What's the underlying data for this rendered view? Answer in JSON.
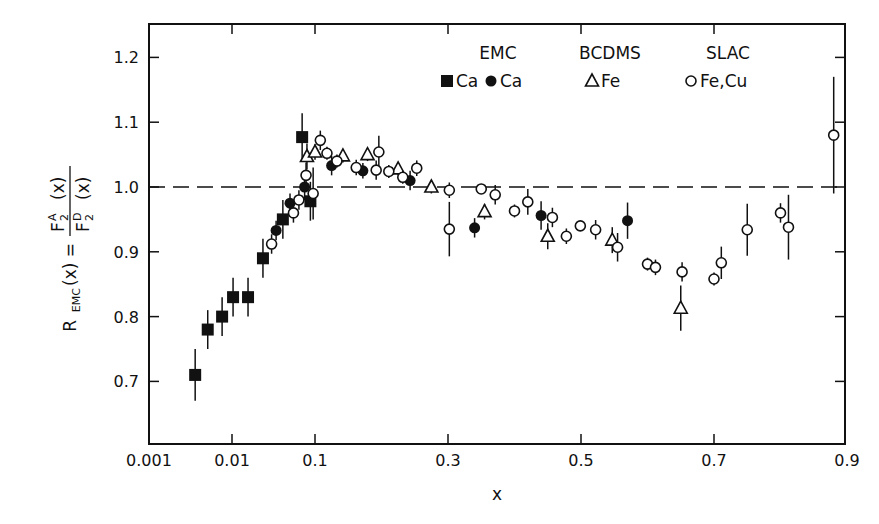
{
  "chart_data": {
    "type": "scatter",
    "title": "",
    "xlabel": "x",
    "ylabel": "R_EMC(x) = F2^A(x) / F2^D(x)",
    "ylabel_parts": {
      "lhs": "R",
      "lhs_sub": "EMC",
      "lhs_arg": "(x) =",
      "num": "F",
      "num_sub": "2",
      "num_sup": "A",
      "num_arg": "(x)",
      "den": "F",
      "den_sub": "2",
      "den_sup": "D",
      "den_arg": "(x)"
    },
    "x_scale": "log from 0.001 to 0.1, linear from 0.1 to 0.9",
    "xlim": [
      0.001,
      0.9
    ],
    "ylim": [
      0.6,
      1.25
    ],
    "x_ticks": [
      "0.001",
      "0.01",
      "0.1",
      "0.3",
      "0.5",
      "0.7",
      "0.9"
    ],
    "y_ticks": [
      "0.7",
      "0.8",
      "0.9",
      "1.0",
      "1.1",
      "1.2"
    ],
    "reference_line": {
      "y": 1.0,
      "style": "dashed"
    },
    "grid": false,
    "legend_position": "top-right inside",
    "legend": [
      {
        "group": "EMC",
        "entries": [
          {
            "marker": "filled-square",
            "label": "Ca"
          },
          {
            "marker": "filled-circle",
            "label": "Ca"
          }
        ]
      },
      {
        "group": "BCDMS",
        "entries": [
          {
            "marker": "open-triangle",
            "label": "Fe"
          }
        ]
      },
      {
        "group": "SLAC",
        "entries": [
          {
            "marker": "open-circle",
            "label": "Fe,Cu"
          }
        ]
      }
    ],
    "series": [
      {
        "name": "EMC Ca (square)",
        "marker": "filled-square",
        "points": [
          {
            "x": 0.0036,
            "y": 0.71,
            "err": 0.04
          },
          {
            "x": 0.0051,
            "y": 0.78,
            "err": 0.03
          },
          {
            "x": 0.0076,
            "y": 0.8,
            "err": 0.03
          },
          {
            "x": 0.0103,
            "y": 0.83,
            "err": 0.03
          },
          {
            "x": 0.0156,
            "y": 0.83,
            "err": 0.03
          },
          {
            "x": 0.0236,
            "y": 0.89,
            "err": 0.03
          },
          {
            "x": 0.041,
            "y": 0.95,
            "err": 0.03
          },
          {
            "x": 0.07,
            "y": 1.077,
            "err": 0.037
          },
          {
            "x": 0.088,
            "y": 0.978,
            "err": 0.03
          }
        ]
      },
      {
        "name": "EMC Ca (circle)",
        "marker": "filled-circle",
        "points": [
          {
            "x": 0.034,
            "y": 0.933,
            "err": 0.015
          },
          {
            "x": 0.05,
            "y": 0.975,
            "err": 0.015
          },
          {
            "x": 0.075,
            "y": 1.0,
            "err": 0.02
          },
          {
            "x": 0.125,
            "y": 1.033,
            "err": 0.015
          },
          {
            "x": 0.172,
            "y": 1.025,
            "err": 0.012
          },
          {
            "x": 0.243,
            "y": 1.01,
            "err": 0.015
          },
          {
            "x": 0.34,
            "y": 0.937,
            "err": 0.015
          },
          {
            "x": 0.44,
            "y": 0.956,
            "err": 0.022
          },
          {
            "x": 0.57,
            "y": 0.948,
            "err": 0.028
          }
        ]
      },
      {
        "name": "BCDMS Fe",
        "marker": "open-triangle",
        "points": [
          {
            "x": 0.08,
            "y": 1.047,
            "err": 0.02
          },
          {
            "x": 0.1,
            "y": 1.054,
            "err": 0.012
          },
          {
            "x": 0.142,
            "y": 1.048,
            "err": 0.01
          },
          {
            "x": 0.179,
            "y": 1.05,
            "err": 0.01
          },
          {
            "x": 0.225,
            "y": 1.028,
            "err": 0.01
          },
          {
            "x": 0.275,
            "y": 1.0,
            "err": 0.01
          },
          {
            "x": 0.355,
            "y": 0.962,
            "err": 0.012
          },
          {
            "x": 0.45,
            "y": 0.924,
            "err": 0.02
          },
          {
            "x": 0.547,
            "y": 0.918,
            "err": 0.02
          },
          {
            "x": 0.65,
            "y": 0.813,
            "err": 0.035
          }
        ]
      },
      {
        "name": "SLAC Fe,Cu",
        "marker": "open-circle",
        "points": [
          {
            "x": 0.03,
            "y": 0.912,
            "err": 0.015
          },
          {
            "x": 0.055,
            "y": 0.96,
            "err": 0.015
          },
          {
            "x": 0.064,
            "y": 0.98,
            "err": 0.015
          },
          {
            "x": 0.078,
            "y": 1.018,
            "err": 0.02
          },
          {
            "x": 0.095,
            "y": 0.99,
            "err": 0.04
          },
          {
            "x": 0.108,
            "y": 1.072,
            "err": 0.015
          },
          {
            "x": 0.118,
            "y": 1.052,
            "err": 0.01
          },
          {
            "x": 0.133,
            "y": 1.04,
            "err": 0.01
          },
          {
            "x": 0.162,
            "y": 1.03,
            "err": 0.012
          },
          {
            "x": 0.196,
            "y": 1.054,
            "err": 0.025
          },
          {
            "x": 0.192,
            "y": 1.026,
            "err": 0.015
          },
          {
            "x": 0.211,
            "y": 1.024,
            "err": 0.01
          },
          {
            "x": 0.232,
            "y": 1.015,
            "err": 0.01
          },
          {
            "x": 0.253,
            "y": 1.029,
            "err": 0.012
          },
          {
            "x": 0.302,
            "y": 0.995,
            "err": 0.012
          },
          {
            "x": 0.302,
            "y": 0.935,
            "err": 0.042
          },
          {
            "x": 0.35,
            "y": 0.997,
            "err": 0.005
          },
          {
            "x": 0.371,
            "y": 0.988,
            "err": 0.015
          },
          {
            "x": 0.4,
            "y": 0.963,
            "err": 0.01
          },
          {
            "x": 0.42,
            "y": 0.977,
            "err": 0.02
          },
          {
            "x": 0.457,
            "y": 0.953,
            "err": 0.015
          },
          {
            "x": 0.478,
            "y": 0.924,
            "err": 0.012
          },
          {
            "x": 0.499,
            "y": 0.94,
            "err": 0.005
          },
          {
            "x": 0.522,
            "y": 0.934,
            "err": 0.015
          },
          {
            "x": 0.555,
            "y": 0.907,
            "err": 0.022
          },
          {
            "x": 0.6,
            "y": 0.881,
            "err": 0.01
          },
          {
            "x": 0.612,
            "y": 0.876,
            "err": 0.012
          },
          {
            "x": 0.652,
            "y": 0.869,
            "err": 0.015
          },
          {
            "x": 0.7,
            "y": 0.858,
            "err": 0.01
          },
          {
            "x": 0.711,
            "y": 0.883,
            "err": 0.025
          },
          {
            "x": 0.75,
            "y": 0.934,
            "err": 0.04
          },
          {
            "x": 0.8,
            "y": 0.96,
            "err": 0.015
          },
          {
            "x": 0.812,
            "y": 0.938,
            "err": 0.05
          },
          {
            "x": 0.88,
            "y": 1.08,
            "err": 0.09
          }
        ]
      }
    ]
  }
}
